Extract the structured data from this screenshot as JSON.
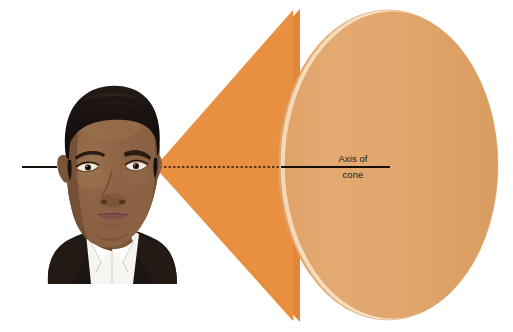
{
  "figure": {
    "background_color": "#ffffff",
    "width": 513,
    "height": 332
  },
  "annotations": {
    "axis_label_line1": "Axis of",
    "axis_label_line2": "cone",
    "axis_label_color": "#231a14"
  },
  "shapes": {
    "cone": {
      "name": "cone-body",
      "fill": "#e8903f",
      "apex_x": 155,
      "apex_y": 167
    },
    "cone_base": {
      "name": "cone-base-ellipse",
      "fill": "#e0a569",
      "highlight": "#f4d6b2",
      "center_x": 388,
      "center_y": 165,
      "radius_x": 110,
      "radius_y": 155
    },
    "axis": {
      "name": "axis-of-cone-line",
      "color": "#1a1208",
      "y": 167,
      "solid_left_start_x": 22,
      "solid_left_end_x": 57,
      "dashed_start_x": 155,
      "dashed_end_x": 281,
      "solid_right_start_x": 281,
      "solid_right_end_x": 390
    },
    "portrait": {
      "name": "man-portrait",
      "hair_color": "#1a1210",
      "skin_color": "#8a6243",
      "skin_shadow": "#6d4a31",
      "jacket_color": "#1d1512",
      "shirt_color": "#f6f4ee",
      "lip_color": "#8f5f55",
      "eye_color": "#2b1d12"
    }
  }
}
